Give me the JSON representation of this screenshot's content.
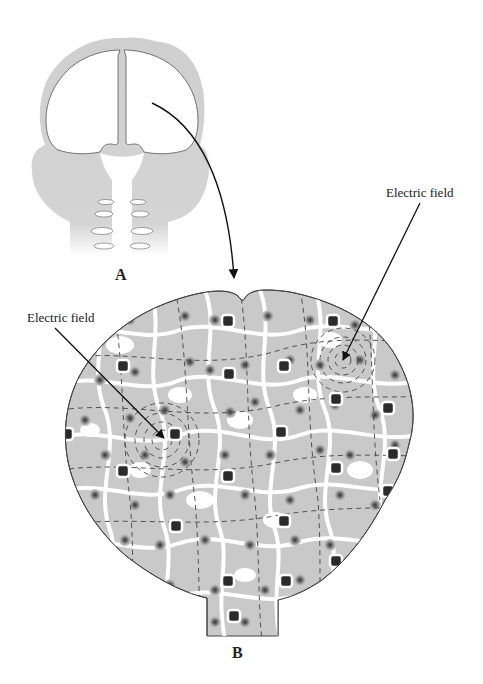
{
  "figure": {
    "panels": [
      {
        "id": "A",
        "label": "A",
        "description": "Frontal view of head showing cerebral hemispheres, skull and upper spinal column"
      },
      {
        "id": "B",
        "label": "B",
        "description": "Enlarged brain tissue with neurons, glial cells and electric field lines"
      }
    ],
    "annotations": [
      {
        "id": "field-left",
        "text": "Electric field"
      },
      {
        "id": "field-right",
        "text": "Electric field"
      }
    ],
    "colors": {
      "tissue": "#c8c8c8",
      "skull": "#cfcfcf",
      "nucleus": "#555555",
      "glia": "#2b2b2b",
      "outline": "#444444",
      "background": "#ffffff"
    }
  }
}
